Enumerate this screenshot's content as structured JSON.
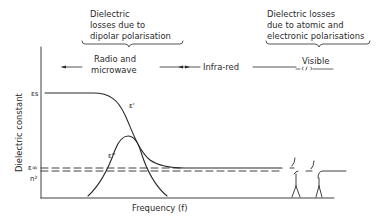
{
  "title_annotations": {
    "left_brace_label": [
      "Dielectric",
      "losses due to",
      "dipolar polarisation"
    ],
    "right_brace_label": [
      "Dielectric losses",
      "due to atomic and",
      "electronic polarisations"
    ]
  },
  "regions": {
    "radio": [
      "Radio and",
      "microwave"
    ],
    "infrared": "Infra-red",
    "visible": "Visible"
  },
  "axes": {
    "ylabel": "Dielectric constant",
    "xlabel": "Frequency (f)",
    "y_ticks": {
      "eps_s": "εs",
      "eps_inf": "ε∞",
      "n2": "n²"
    }
  },
  "curves": {
    "eps_real": "ε'",
    "eps_imag": "ε''"
  },
  "colors": {
    "ink": "#2a2a2a",
    "background": "#ffffff"
  }
}
